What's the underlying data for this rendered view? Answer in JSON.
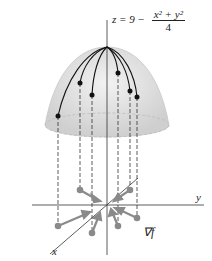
{
  "figure": {
    "equation": {
      "lhs": "z = 9 −",
      "numerator": "x² + y²",
      "denominator": "4"
    },
    "labels": {
      "y_axis": "y",
      "x_axis": "x",
      "gradient": "∇f"
    },
    "colors": {
      "surface": "#d9d9d9",
      "curves": "#111111",
      "arrows": "#8a8a8a",
      "axes": "#333333"
    },
    "surface_points": [
      {
        "x": 58,
        "y": 116
      },
      {
        "x": 80,
        "y": 83
      },
      {
        "x": 92,
        "y": 95
      },
      {
        "x": 118,
        "y": 73
      },
      {
        "x": 130,
        "y": 91
      },
      {
        "x": 137,
        "y": 97
      }
    ]
  }
}
